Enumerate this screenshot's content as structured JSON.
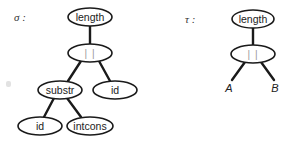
{
  "diagram": {
    "type": "syntax-tree-pair",
    "trees": [
      {
        "label": "σ :",
        "nodes": [
          {
            "id": "n0",
            "text": "length",
            "cx": 90,
            "cy": 17,
            "rx": 22,
            "ry": 9
          },
          {
            "id": "n1",
            "text": "| |",
            "cx": 90,
            "cy": 53,
            "rx": 22,
            "ry": 9
          },
          {
            "id": "n2",
            "text": "substr",
            "cx": 60,
            "cy": 90,
            "rx": 22,
            "ry": 9
          },
          {
            "id": "n3",
            "text": "id",
            "cx": 115,
            "cy": 90,
            "rx": 22,
            "ry": 9
          },
          {
            "id": "n4",
            "text": "id",
            "cx": 40,
            "cy": 126,
            "rx": 22,
            "ry": 9
          },
          {
            "id": "n5",
            "text": "intcons",
            "cx": 90,
            "cy": 126,
            "rx": 23,
            "ry": 9
          }
        ],
        "edges": [
          [
            "n0",
            "n1"
          ],
          [
            "n1",
            "n2"
          ],
          [
            "n1",
            "n3"
          ],
          [
            "n2",
            "n4"
          ],
          [
            "n2",
            "n5"
          ]
        ]
      },
      {
        "label": "τ :",
        "nodes": [
          {
            "id": "m0",
            "text": "length",
            "cx": 253,
            "cy": 19,
            "rx": 21,
            "ry": 9
          },
          {
            "id": "m1",
            "text": "| |",
            "cx": 253,
            "cy": 54,
            "rx": 22,
            "ry": 9
          }
        ],
        "leaves": [
          {
            "id": "A",
            "text": "A",
            "x": 229,
            "y": 88
          },
          {
            "id": "B",
            "text": "B",
            "x": 275,
            "y": 88
          }
        ],
        "edges": [
          [
            "m0",
            "m1"
          ],
          [
            "m1",
            "A"
          ],
          [
            "m1",
            "B"
          ]
        ]
      }
    ]
  }
}
